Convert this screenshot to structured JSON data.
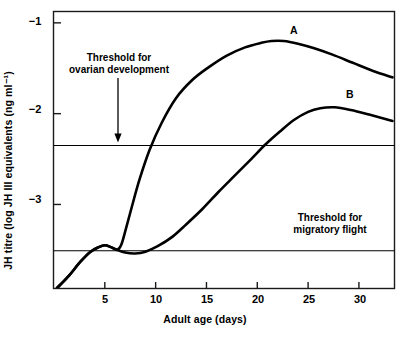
{
  "chart_data": {
    "type": "line",
    "title": "",
    "xlabel": "Adult age (days)",
    "ylabel": "JH titre (log JH III equivalents (ng ml⁻¹)",
    "xlim": [
      0,
      33.5
    ],
    "ylim": [
      -3.92,
      -0.875
    ],
    "grid": false,
    "legend_position": "inline-labels",
    "xticks": [
      5,
      10,
      15,
      20,
      25,
      30
    ],
    "xticklabels": [
      "5",
      "10",
      "15",
      "20",
      "25",
      "30"
    ],
    "yticks": [
      -1,
      -2,
      -3
    ],
    "yticklabels": [
      "−1",
      "−2",
      "−3"
    ],
    "series": [
      {
        "name": "A",
        "label": "A",
        "color": "#000000",
        "x": [
          0.3,
          1.5,
          2.6,
          3.6,
          4.4,
          5.0,
          5.6,
          6.2,
          6.6,
          7.0,
          7.6,
          8.4,
          9.4,
          10.6,
          12.0,
          13.6,
          15.2,
          17.0,
          18.8,
          20.4,
          21.4,
          22.6,
          24.0,
          25.6,
          27.4,
          29.4,
          31.4,
          33.3
        ],
        "y": [
          -3.92,
          -3.78,
          -3.63,
          -3.52,
          -3.47,
          -3.45,
          -3.47,
          -3.5,
          -3.45,
          -3.3,
          -3.05,
          -2.73,
          -2.4,
          -2.1,
          -1.83,
          -1.63,
          -1.49,
          -1.36,
          -1.27,
          -1.22,
          -1.2,
          -1.2,
          -1.23,
          -1.28,
          -1.35,
          -1.44,
          -1.53,
          -1.6
        ],
        "annotation": "A"
      },
      {
        "name": "B",
        "label": "B",
        "color": "#000000",
        "x": [
          0.3,
          1.5,
          2.6,
          3.6,
          4.4,
          5.0,
          5.6,
          6.2,
          7.0,
          8.0,
          9.0,
          10.2,
          11.6,
          13.0,
          14.6,
          16.2,
          17.8,
          19.4,
          20.8,
          22.2,
          23.6,
          25.0,
          26.2,
          27.6,
          29.2,
          31.0,
          33.3
        ],
        "y": [
          -3.92,
          -3.78,
          -3.63,
          -3.52,
          -3.47,
          -3.45,
          -3.47,
          -3.5,
          -3.53,
          -3.54,
          -3.52,
          -3.46,
          -3.36,
          -3.22,
          -3.05,
          -2.86,
          -2.68,
          -2.5,
          -2.34,
          -2.2,
          -2.07,
          -1.98,
          -1.94,
          -1.93,
          -1.96,
          -2.01,
          -2.08
        ],
        "annotation": "B"
      }
    ],
    "threshold_lines": [
      {
        "id": "ovarian",
        "value": -2.35,
        "label_line1": "Threshold for",
        "label_line2": "ovarian development",
        "arrow": true,
        "color": "#000000"
      },
      {
        "id": "migratory",
        "value": -3.51,
        "label_line1": "Threshold for",
        "label_line2": "migratory flight",
        "arrow": false,
        "color": "#000000"
      }
    ]
  },
  "figure": {
    "ylabel": "JH titre (log JH III equivalents (ng ml⁻¹)",
    "xlabel": "Adult age (days)",
    "xticks": [
      "5",
      "10",
      "15",
      "20",
      "25",
      "30"
    ],
    "yticks": [
      "−1",
      "−2",
      "−3"
    ],
    "curve_a_label": "A",
    "curve_b_label": "B",
    "ovarian_line1": "Threshold for",
    "ovarian_line2": "ovarian development",
    "migratory_line1": "Threshold for",
    "migratory_line2": "migratory flight"
  }
}
